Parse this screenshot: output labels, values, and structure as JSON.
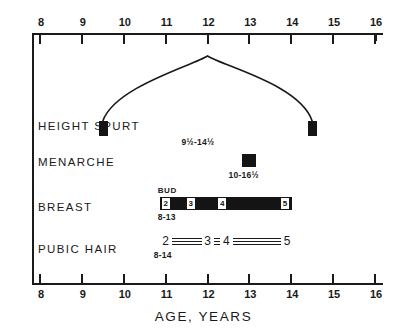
{
  "chart_data": {
    "type": "table",
    "xlabel": "AGE, YEARS",
    "ylabel": "",
    "xlim": [
      8,
      16
    ],
    "xticks": [
      "8",
      "9",
      "10",
      "11",
      "12",
      "13",
      "14",
      "15",
      "16"
    ],
    "grid": false,
    "legend": "none",
    "rows": [
      {
        "label": "HEIGHT SPURT",
        "kind": "curve-with-endpoints",
        "range_text": "9½ - 14½",
        "start_age": 9.5,
        "peak_age": 12.0,
        "end_age": 14.5
      },
      {
        "label": "MENARCHE",
        "kind": "point",
        "range_text": "10 - 16½",
        "age": 13.0
      },
      {
        "label": "BREAST",
        "kind": "staged-bar",
        "range_text": "8 - 13",
        "start_age": 8.0,
        "end_age": 13.3,
        "bud_label": "BUD",
        "stages": [
          {
            "stage": "2",
            "age": 11.0
          },
          {
            "stage": "3",
            "age": 11.6
          },
          {
            "stage": "4",
            "age": 12.35
          },
          {
            "stage": "5",
            "age": 13.85
          }
        ]
      },
      {
        "label": "PUBIC HAIR",
        "kind": "staged-rail",
        "range_text": "8 - 14",
        "start_age": 8.0,
        "end_age": 14.0,
        "stages": [
          {
            "stage": "2",
            "age": 11.0
          },
          {
            "stage": "3",
            "age": 12.0
          },
          {
            "stage": "4",
            "age": 12.45
          },
          {
            "stage": "5",
            "age": 13.9
          }
        ]
      }
    ]
  },
  "axis": {
    "title": "AGE, YEARS",
    "ticks": [
      "8",
      "9",
      "10",
      "11",
      "12",
      "13",
      "14",
      "15",
      "16"
    ]
  },
  "rows": {
    "height_spurt": {
      "label": "HEIGHT SPURT",
      "range": "9½-14½"
    },
    "menarche": {
      "label": "MENARCHE",
      "range": "10-16½"
    },
    "breast": {
      "label": "BREAST",
      "range": "8-13",
      "bud": "BUD",
      "stage_2": "2",
      "stage_3": "3",
      "stage_4": "4",
      "stage_5": "5"
    },
    "pubic_hair": {
      "label": "PUBIC HAIR",
      "range": "8-14",
      "stage_2": "2",
      "stage_3": "3",
      "stage_4": "4",
      "stage_5": "5"
    }
  },
  "colors": {
    "ink": "#1a1a1a",
    "fill": "#141414",
    "paper": "#ffffff"
  }
}
